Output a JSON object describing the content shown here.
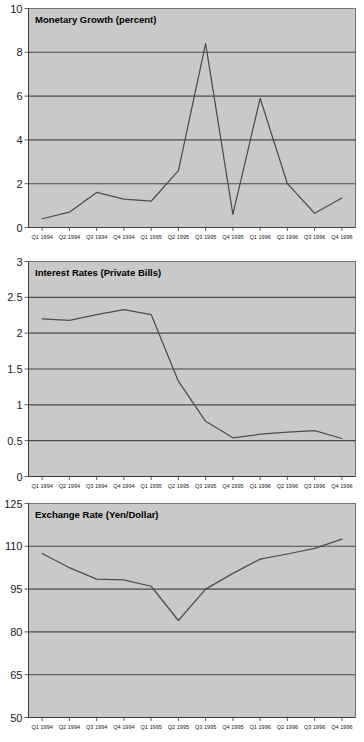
{
  "document": {
    "title": "Japanese Macroeconomic Indicators 1994-1996",
    "background_color": "#ffffff",
    "plot_background_color": "#c9c9c9",
    "line_color": "#4d4d4d",
    "gridline_color": "#4a4a4a"
  },
  "chart_data": [
    {
      "id": "monetary-growth",
      "type": "line",
      "title": "Monetary Growth (percent)",
      "xlabel": "",
      "ylabel": "",
      "ylim": [
        0,
        10
      ],
      "yticks": [
        "0",
        "2",
        "4",
        "6",
        "8",
        "10"
      ],
      "ytick_values": [
        0,
        2,
        4,
        6,
        8,
        10
      ],
      "grid": true,
      "legend": "none",
      "categories": [
        "Q1 1994",
        "Q2 1994",
        "Q3 1994",
        "Q4 1994",
        "Q1 1995",
        "Q2 1995",
        "Q3 1995",
        "Q4 1995",
        "Q1 1996",
        "Q2 1996",
        "Q3 1996",
        "Q4 1996"
      ],
      "values": [
        0.4,
        0.7,
        1.6,
        1.3,
        1.2,
        2.6,
        8.4,
        0.6,
        5.9,
        2.0,
        0.65,
        1.35
      ]
    },
    {
      "id": "interest-rates",
      "type": "line",
      "title": "Interest Rates (Private Bills)",
      "xlabel": "",
      "ylabel": "",
      "ylim": [
        0,
        3
      ],
      "yticks": [
        "0",
        "0.5",
        "1",
        "1.5",
        "2",
        "2.5",
        "3"
      ],
      "ytick_values": [
        0,
        0.5,
        1,
        1.5,
        2,
        2.5,
        3
      ],
      "grid": true,
      "legend": "none",
      "categories": [
        "Q1 1994",
        "Q2 1994",
        "Q3 1994",
        "Q4 1994",
        "Q1 1995",
        "Q2 1995",
        "Q3 1995",
        "Q4 1995",
        "Q1 1996",
        "Q2 1996",
        "Q3 1996",
        "Q4 1996"
      ],
      "values": [
        2.2,
        2.18,
        2.26,
        2.33,
        2.26,
        1.33,
        0.77,
        0.54,
        0.59,
        0.62,
        0.64,
        0.53
      ]
    },
    {
      "id": "exchange-rate",
      "type": "line",
      "title": "Exchange Rate (Yen/Dollar)",
      "xlabel": "",
      "ylabel": "",
      "ylim": [
        50,
        125
      ],
      "yticks": [
        "50",
        "65",
        "80",
        "95",
        "110",
        "125"
      ],
      "ytick_values": [
        50,
        65,
        80,
        95,
        110,
        125
      ],
      "grid": true,
      "legend": "none",
      "categories": [
        "Q1 1994",
        "Q2 1994",
        "Q3 1994",
        "Q4 1994",
        "Q1 1995",
        "Q2 1995",
        "Q3 1995",
        "Q4 1995",
        "Q1 1996",
        "Q2 1996",
        "Q3 1996",
        "Q4 1996"
      ],
      "values": [
        107.5,
        102.5,
        98.5,
        98.2,
        96.0,
        84.0,
        95.0,
        100.5,
        105.5,
        107.3,
        109.3,
        112.5
      ]
    }
  ]
}
